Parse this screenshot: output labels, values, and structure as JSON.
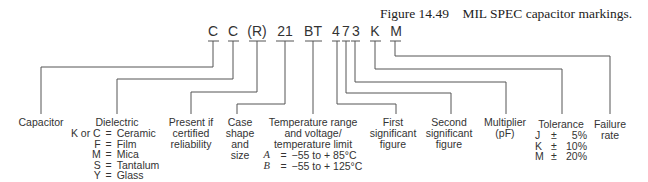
{
  "caption": {
    "figure_number": "Figure 14.49",
    "title": "MIL SPEC capacitor markings."
  },
  "code_segments": [
    {
      "text": "C",
      "meaning": "Capacitor"
    },
    {
      "text": "C",
      "meaning": "Dielectric"
    },
    {
      "text": "(R)",
      "meaning": "Present if certified reliability"
    },
    {
      "text": "21",
      "meaning": "Case shape and size"
    },
    {
      "text": "BT",
      "meaning": "Temperature range and voltage/temperature limit"
    },
    {
      "text": "4",
      "meaning": "First significant figure"
    },
    {
      "text": "7",
      "meaning": "Second significant figure"
    },
    {
      "text": "3",
      "meaning": "Multiplier (pF)"
    },
    {
      "text": "K",
      "meaning": "Tolerance"
    },
    {
      "text": "M",
      "meaning": "Failure rate"
    }
  ],
  "labels": {
    "capacitor": [
      "Capacitor"
    ],
    "dielectric": [
      "Dielectric"
    ],
    "dielectric_table": [
      {
        "code": "K or C",
        "eq": "=",
        "value": "Ceramic"
      },
      {
        "code": "F",
        "eq": "=",
        "value": "Film"
      },
      {
        "code": "M",
        "eq": "=",
        "value": "Mica"
      },
      {
        "code": "S",
        "eq": "=",
        "value": "Tantalum"
      },
      {
        "code": "Y",
        "eq": "=",
        "value": "Glass"
      }
    ],
    "reliability": [
      "Present if",
      "certified",
      "reliability"
    ],
    "case": [
      "Case",
      "shape",
      "and",
      "size"
    ],
    "temperature": [
      "Temperature range",
      "and voltage/",
      "temperature limit"
    ],
    "temperature_table": [
      {
        "code": "A",
        "eq": "=",
        "value": "−55 to + 85°C"
      },
      {
        "code": "B",
        "eq": "=",
        "value": "−55 to + 125°C"
      }
    ],
    "first": [
      "First",
      "significant",
      "figure"
    ],
    "second": [
      "Second",
      "significant",
      "figure"
    ],
    "multiplier": [
      "Multiplier",
      "(pF)"
    ],
    "tolerance": [
      "Tolerance"
    ],
    "tolerance_table": [
      {
        "code": "J",
        "pm": "±",
        "value": "5%"
      },
      {
        "code": "K",
        "pm": "±",
        "value": "10%"
      },
      {
        "code": "M",
        "pm": "±",
        "value": "20%"
      }
    ],
    "failure": [
      "Failure",
      "rate"
    ]
  }
}
